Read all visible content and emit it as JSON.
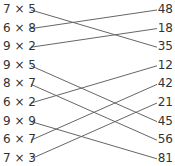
{
  "left": [
    "7 × 5",
    "6 × 8",
    "9 × 2",
    "9 × 5",
    "8 × 7",
    "6 × 2",
    "9 × 9",
    "6 × 7",
    "7 × 3"
  ],
  "right": [
    "48",
    "18",
    "35",
    "12",
    "42",
    "21",
    "45",
    "56",
    "81"
  ],
  "connections": [
    [
      0,
      2
    ],
    [
      1,
      0
    ],
    [
      2,
      1
    ],
    [
      3,
      6
    ],
    [
      4,
      7
    ],
    [
      5,
      3
    ],
    [
      6,
      8
    ],
    [
      7,
      4
    ],
    [
      8,
      5
    ]
  ],
  "line_color": "#666666"
}
